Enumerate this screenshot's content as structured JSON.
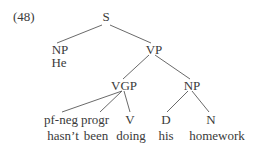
{
  "example_number": "(48)",
  "nodes": {
    "S": "S",
    "NP_subj": "NP",
    "He": "He",
    "VP": "VP",
    "VGP": "VGP",
    "NP_obj": "NP",
    "pf_neg": "pf-neg",
    "progr": "progr",
    "V": "V",
    "D": "D",
    "N": "N"
  },
  "words": {
    "hasnt": "hasn’t",
    "been": "been",
    "doing": "doing",
    "his": "his",
    "homework": "homework"
  },
  "colors": {
    "text": "#3a3a3a",
    "lines": "#6a6a6a",
    "background": "#ffffff"
  }
}
